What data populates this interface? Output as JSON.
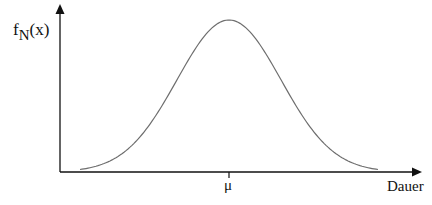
{
  "chart_data": {
    "type": "line",
    "title": "",
    "ylabel": "f_N(x)",
    "ylabel_parts": {
      "main": "f",
      "sub": "N",
      "arg": "(x)"
    },
    "xlabel": "Dauer",
    "x_ticks": [
      {
        "label": "μ",
        "position": "center"
      }
    ],
    "grid": false,
    "legend": null,
    "series": [
      {
        "name": "f_N(x)",
        "distribution": "normal",
        "mean_label": "μ"
      }
    ]
  },
  "labels": {
    "y_main": "f",
    "y_sub": "N",
    "y_arg": "(x)",
    "mu": "μ",
    "x_axis": "Dauer"
  },
  "colors": {
    "axis": "#111111",
    "curve": "#6e6e6e",
    "background": "#ffffff"
  }
}
